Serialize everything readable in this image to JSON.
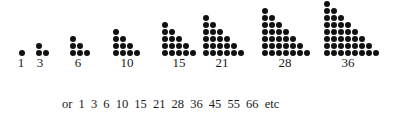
{
  "figure": {
    "triangles": [
      {
        "n": 1,
        "label": "1",
        "left_x": 19,
        "label_x": 21
      },
      {
        "n": 2,
        "label": "3",
        "left_x": 36,
        "label_x": 40
      },
      {
        "n": 3,
        "label": "6",
        "left_x": 70,
        "label_x": 78
      },
      {
        "n": 4,
        "label": "10",
        "left_x": 113,
        "label_x": 127
      },
      {
        "n": 5,
        "label": "15",
        "left_x": 162,
        "label_x": 179
      },
      {
        "n": 6,
        "label": "21",
        "left_x": 203,
        "label_x": 222
      },
      {
        "n": 7,
        "label": "28",
        "left_x": 262,
        "label_x": 285
      },
      {
        "n": 8,
        "label": "36",
        "left_x": 324,
        "label_x": 348
      }
    ],
    "dot_pitch_x": 7,
    "dot_pitch_y": 7,
    "bottom_row_y": 50,
    "dot_color": "#111111"
  },
  "caption": {
    "text": "or 1  3  6  10  15  21  28  36  45  55  66 etc",
    "sequence": [
      "1",
      "3",
      "6",
      "10",
      "15",
      "21",
      "28",
      "36",
      "45",
      "55",
      "66"
    ],
    "suffix": "etc"
  }
}
